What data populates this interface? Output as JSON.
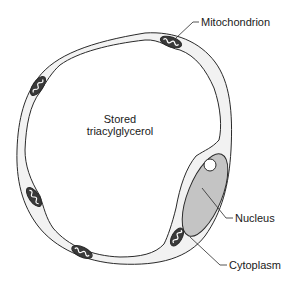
{
  "diagram": {
    "labels": {
      "mitochondrion": "Mitochondrion",
      "nucleus": "Nucleus",
      "cytoplasm": "Cytoplasm",
      "stored_line1": "Stored",
      "stored_line2": "triacylglycerol"
    },
    "colors": {
      "line": "#2a2a2a",
      "cytoplasm": "#f2f2f2",
      "nucleus": "#c4c4c4",
      "mitochondrion": "#3a3a3a",
      "background": "#ffffff"
    },
    "mitochondria_count": 5
  }
}
